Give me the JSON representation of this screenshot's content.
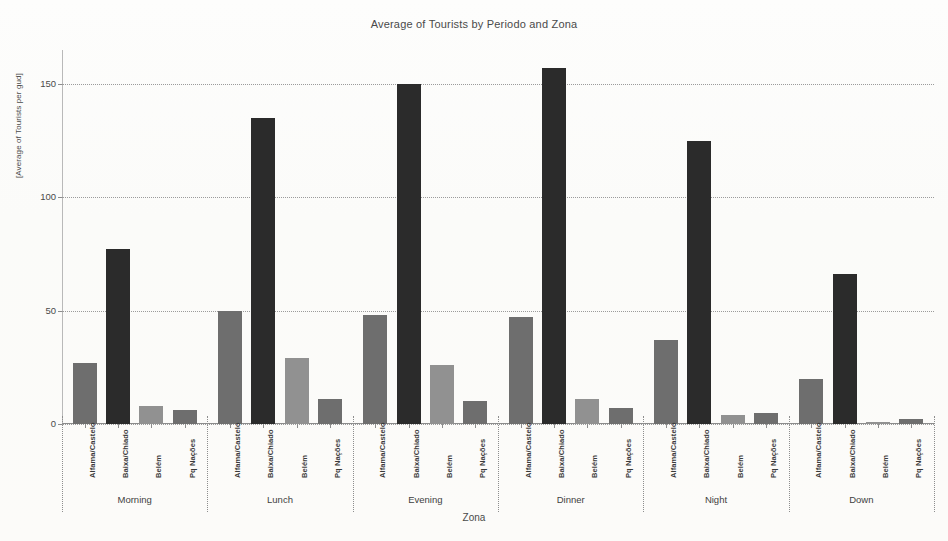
{
  "chart_data": {
    "type": "bar",
    "title": "Average of Tourists by Periodo and Zona",
    "xlabel": "Zona",
    "ylabel": "[Average of Tourists per gud]",
    "ylim": [
      0,
      165
    ],
    "yticks": [
      0,
      50,
      100,
      150
    ],
    "ytick_labels": [
      "0",
      "50",
      "100",
      "150"
    ],
    "grid": "horizontal-dotted",
    "legend": "none",
    "group_axis_name": "Periodo",
    "categories": [
      "Alfama/Castelo",
      "Baixa/Chiado",
      "Belém",
      "Pq Nações"
    ],
    "groups": [
      {
        "label": "Morning",
        "bars": [
          {
            "category": "Alfama/Castelo",
            "value": 27,
            "color": "#6e6e6e"
          },
          {
            "category": "Baixa/Chiado",
            "value": 77,
            "color": "#2b2b2b"
          },
          {
            "category": "Belém",
            "value": 8,
            "color": "#919191"
          },
          {
            "category": "Pq Nações",
            "value": 6,
            "color": "#6e6e6e"
          }
        ]
      },
      {
        "label": "Lunch",
        "bars": [
          {
            "category": "Alfama/Castelo",
            "value": 50,
            "color": "#6e6e6e"
          },
          {
            "category": "Baixa/Chiado",
            "value": 135,
            "color": "#2b2b2b"
          },
          {
            "category": "Belém",
            "value": 29,
            "color": "#919191"
          },
          {
            "category": "Pq Nações",
            "value": 11,
            "color": "#6e6e6e"
          }
        ]
      },
      {
        "label": "Evening",
        "bars": [
          {
            "category": "Alfama/Castelo",
            "value": 48,
            "color": "#6e6e6e"
          },
          {
            "category": "Baixa/Chiado",
            "value": 150,
            "color": "#2b2b2b"
          },
          {
            "category": "Belém",
            "value": 26,
            "color": "#919191"
          },
          {
            "category": "Pq Nações",
            "value": 10,
            "color": "#6e6e6e"
          }
        ]
      },
      {
        "label": "Dinner",
        "bars": [
          {
            "category": "Alfama/Castelo",
            "value": 47,
            "color": "#6e6e6e"
          },
          {
            "category": "Baixa/Chiado",
            "value": 157,
            "color": "#2b2b2b"
          },
          {
            "category": "Belém",
            "value": 11,
            "color": "#919191"
          },
          {
            "category": "Pq Nações",
            "value": 7,
            "color": "#6e6e6e"
          }
        ]
      },
      {
        "label": "Night",
        "bars": [
          {
            "category": "Alfama/Castelo",
            "value": 37,
            "color": "#6e6e6e"
          },
          {
            "category": "Baixa/Chiado",
            "value": 125,
            "color": "#2b2b2b"
          },
          {
            "category": "Belém",
            "value": 4,
            "color": "#919191"
          },
          {
            "category": "Pq Nações",
            "value": 5,
            "color": "#6e6e6e"
          }
        ]
      },
      {
        "label": "Down",
        "bars": [
          {
            "category": "Alfama/Castelo",
            "value": 20,
            "color": "#6e6e6e"
          },
          {
            "category": "Baixa/Chiado",
            "value": 66,
            "color": "#2b2b2b"
          },
          {
            "category": "Belém",
            "value": 1,
            "color": "#919191"
          },
          {
            "category": "Pq Nações",
            "value": 2,
            "color": "#6e6e6e"
          }
        ]
      }
    ]
  }
}
